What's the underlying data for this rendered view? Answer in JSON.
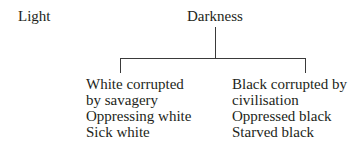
{
  "diagram": {
    "type": "tree",
    "left_label": "Light",
    "root": "Darkness",
    "branches": [
      {
        "lines": [
          "White corrupted",
          "by savagery",
          "Oppressing white",
          "Sick white"
        ]
      },
      {
        "lines": [
          "Black corrupted by",
          "civilisation",
          "Oppressed black",
          "Starved black"
        ]
      }
    ]
  }
}
